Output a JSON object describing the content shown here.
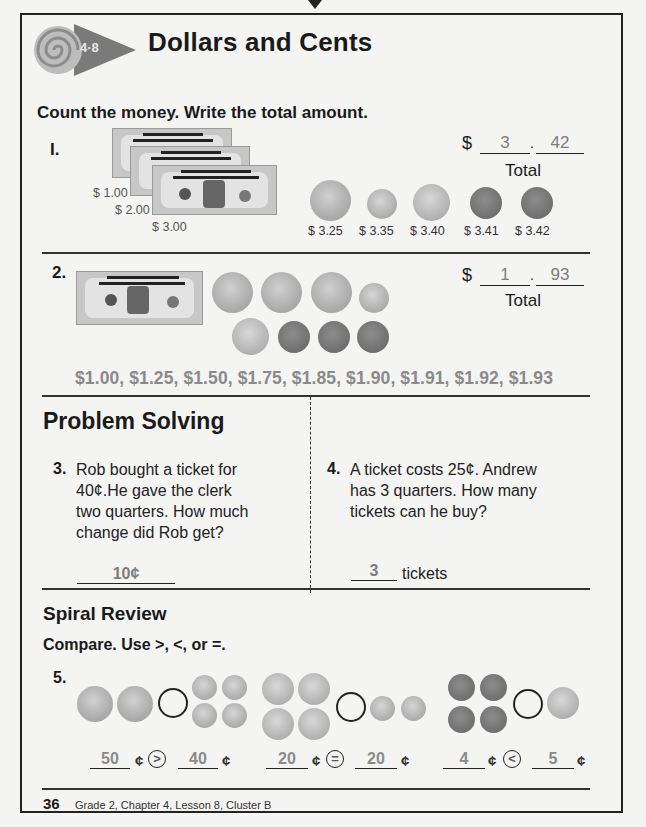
{
  "header": {
    "lesson_badge": "4·8",
    "title": "Dollars and Cents"
  },
  "instructions": "Count the money. Write the total amount.",
  "problem1": {
    "number": "I.",
    "bill_labels": [
      "$ 1.00",
      "$ 2.00",
      "$ 3.00"
    ],
    "coins": [
      {
        "type": "quarter",
        "label": "$ 3.25"
      },
      {
        "type": "dime",
        "label": "$ 3.35"
      },
      {
        "type": "nickel",
        "label": "$ 3.40"
      },
      {
        "type": "penny",
        "label": "$ 3.41"
      },
      {
        "type": "penny",
        "label": "$ 3.42"
      }
    ],
    "answer": {
      "dollar_sign": "$",
      "dollars": "3",
      "dot": ".",
      "cents": "42",
      "total_label": "Total"
    }
  },
  "problem2": {
    "number": "2.",
    "counting_sequence": "$1.00, $1.25, $1.50, $1.75, $1.85, $1.90, $1.91, $1.92, $1.93",
    "answer": {
      "dollar_sign": "$",
      "dollars": "1",
      "dot": ".",
      "cents": "93",
      "total_label": "Total"
    }
  },
  "problem_solving": {
    "heading": "Problem Solving",
    "q3": {
      "number": "3.",
      "lines": [
        "Rob bought a ticket for",
        "40¢.He gave the clerk",
        "two quarters. How much",
        "change did Rob get?"
      ],
      "answer": "10¢"
    },
    "q4": {
      "number": "4.",
      "lines": [
        "A ticket costs 25¢. Andrew",
        "has 3 quarters. How many",
        "tickets can he buy?"
      ],
      "answer": "3",
      "unit": "tickets"
    }
  },
  "spiral_review": {
    "heading": "Spiral Review",
    "instructions": "Compare. Use >, <, or =.",
    "number": "5.",
    "comparisons": [
      {
        "left": "50",
        "symbol": ">",
        "right": "40",
        "cent": "¢"
      },
      {
        "left": "20",
        "symbol": "=",
        "right": "20",
        "cent": "¢"
      },
      {
        "left": "4",
        "symbol": "<",
        "right": "5",
        "cent": "¢"
      }
    ]
  },
  "footer": {
    "page_number": "36",
    "text": "Grade 2, Chapter 4, Lesson 8, Cluster B"
  }
}
